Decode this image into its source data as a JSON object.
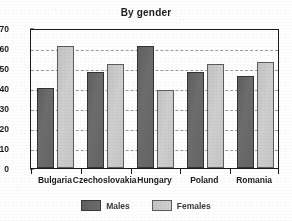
{
  "chart_data": {
    "type": "bar",
    "title": "By gender",
    "xlabel": "",
    "ylabel": "",
    "ylim": [
      0,
      70
    ],
    "yticks": [
      0,
      10,
      20,
      30,
      40,
      50,
      60,
      70
    ],
    "grid": true,
    "legend_position": "bottom-center",
    "categories": [
      "Bulgaria",
      "Czechoslovakia",
      "Hungary",
      "Poland",
      "Romania"
    ],
    "series": [
      {
        "name": "Males",
        "color": "#6a6a6a",
        "values": [
          40,
          48,
          61,
          48,
          46
        ]
      },
      {
        "name": "Females",
        "color": "#c8c8c8",
        "values": [
          61,
          52,
          39,
          52,
          53
        ]
      }
    ]
  },
  "axis": {
    "y_tick_labels": [
      "70",
      "60",
      "50",
      "40",
      "30",
      "20",
      "10",
      "0"
    ],
    "x_tick_labels": [
      "Bulgaria",
      "Czechoslovakia",
      "Hungary",
      "Poland",
      "Romania"
    ]
  },
  "legend": {
    "items": [
      {
        "label": "Males",
        "swatch": "dark-gray-swatch"
      },
      {
        "label": "Females",
        "swatch": "light-gray-swatch"
      }
    ]
  }
}
